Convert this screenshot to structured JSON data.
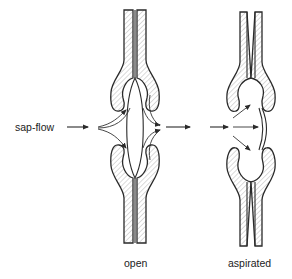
{
  "labels": {
    "sap_flow": "sap-flow",
    "open": "open",
    "aspirated": "aspirated"
  },
  "colors": {
    "stroke": "#2a2a2a",
    "hatch": "#bdbdbd",
    "text": "#222222",
    "background": "#ffffff"
  },
  "diagram": {
    "type": "bordered-pit-schematic",
    "states": [
      "open",
      "aspirated"
    ],
    "flow_direction": "left-to-right"
  }
}
